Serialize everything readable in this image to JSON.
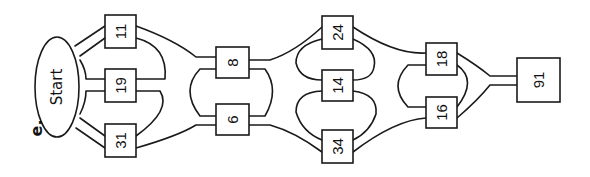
{
  "figure": {
    "label": "e."
  },
  "colors": {
    "stroke": "#1a1a1a",
    "background": "#ffffff",
    "text": "#111111"
  },
  "start": {
    "label": "Start",
    "cx": 57,
    "cy": 87,
    "rx": 22,
    "ry": 50
  },
  "nodes": [
    {
      "id": "n11",
      "label": "11",
      "x": 105,
      "y": 15,
      "w": 31,
      "h": 33
    },
    {
      "id": "n19",
      "label": "19",
      "x": 105,
      "y": 69,
      "w": 31,
      "h": 33
    },
    {
      "id": "n31",
      "label": "31",
      "x": 105,
      "y": 124,
      "w": 31,
      "h": 33
    },
    {
      "id": "n8",
      "label": "8",
      "x": 216,
      "y": 47,
      "w": 33,
      "h": 31
    },
    {
      "id": "n6",
      "label": "6",
      "x": 216,
      "y": 104,
      "w": 33,
      "h": 31
    },
    {
      "id": "n24",
      "label": "24",
      "x": 322,
      "y": 16,
      "w": 31,
      "h": 33
    },
    {
      "id": "n14",
      "label": "14",
      "x": 322,
      "y": 70,
      "w": 31,
      "h": 31
    },
    {
      "id": "n34",
      "label": "34",
      "x": 322,
      "y": 130,
      "w": 31,
      "h": 33
    },
    {
      "id": "n18",
      "label": "18",
      "x": 426,
      "y": 43,
      "w": 31,
      "h": 32
    },
    {
      "id": "n16",
      "label": "16",
      "x": 426,
      "y": 97,
      "w": 31,
      "h": 31
    },
    {
      "id": "n91",
      "label": "91",
      "x": 517,
      "y": 58,
      "w": 43,
      "h": 44
    }
  ]
}
